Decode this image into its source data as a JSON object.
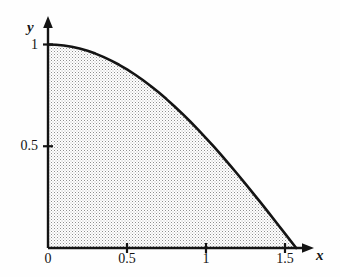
{
  "figure": {
    "background_color": "#fefefe",
    "ink_color": "#141414",
    "shading_color": "#9a9a9a",
    "shading_label": "stippled-region"
  },
  "axes": {
    "x_axis_label": "x",
    "y_axis_label": "y",
    "x_axis_arrow": "arrow-right-icon",
    "y_axis_arrow": "arrow-up-icon",
    "origin_label": "0",
    "x_ticks": [
      {
        "value": 0,
        "label": "0"
      },
      {
        "value": 0.5,
        "label": "0.5"
      },
      {
        "value": 1,
        "label": "1"
      },
      {
        "value": 1.5,
        "label": "1.5"
      }
    ],
    "y_ticks": [
      {
        "value": 0.5,
        "label": "0.5"
      },
      {
        "value": 1,
        "label": "1"
      }
    ]
  },
  "chart_data": {
    "type": "line",
    "title": "",
    "subtitle": "",
    "xlabel": "x",
    "ylabel": "y",
    "xlim": [
      0,
      1.5708
    ],
    "ylim": [
      0,
      1
    ],
    "grid": false,
    "legend": null,
    "fill": {
      "enabled": true,
      "style": "stipple",
      "between": [
        "curve",
        "y=0"
      ],
      "from_x": 0,
      "to_x": 1.5708
    },
    "series": [
      {
        "name": "y = cos(x)",
        "equation": "cos(x)",
        "x": [
          0,
          0.05,
          0.1,
          0.15,
          0.2,
          0.25,
          0.3,
          0.35,
          0.4,
          0.45,
          0.5,
          0.55,
          0.6,
          0.65,
          0.7,
          0.75,
          0.8,
          0.85,
          0.9,
          0.95,
          1.0,
          1.05,
          1.1,
          1.15,
          1.2,
          1.25,
          1.3,
          1.35,
          1.4,
          1.45,
          1.5,
          1.5708
        ],
        "values": [
          1.0,
          0.9988,
          0.995,
          0.9888,
          0.9801,
          0.9689,
          0.9553,
          0.9394,
          0.9211,
          0.9004,
          0.8776,
          0.8525,
          0.8253,
          0.7961,
          0.7648,
          0.7317,
          0.6967,
          0.66,
          0.6216,
          0.5817,
          0.5403,
          0.4976,
          0.4536,
          0.4085,
          0.3624,
          0.3153,
          0.2675,
          0.219,
          0.17,
          0.1205,
          0.0707,
          0.0
        ]
      }
    ],
    "annotations": []
  }
}
